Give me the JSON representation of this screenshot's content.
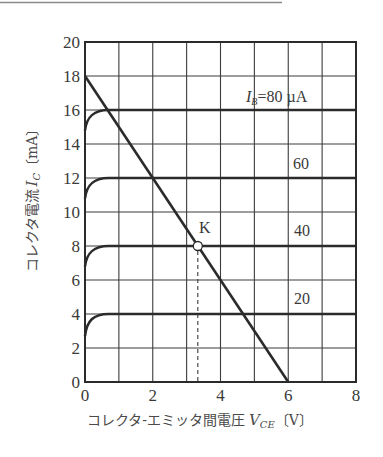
{
  "chart_data": {
    "type": "line",
    "title": "",
    "xlabel": "コレクタ-エミッタ間電圧 V_CE〔V〕",
    "ylabel": "コレクタ電流 I_C〔mA〕",
    "xlim": [
      0,
      8
    ],
    "ylim": [
      0,
      20
    ],
    "grid": true,
    "x_ticks": [
      0,
      2,
      4,
      6,
      8
    ],
    "y_ticks": [
      0,
      2,
      4,
      6,
      8,
      10,
      12,
      14,
      16,
      18,
      20
    ],
    "series": [
      {
        "name": "I_B=20µA",
        "label": "20",
        "saturation_current_mA": 4,
        "points": [
          [
            0,
            2.7
          ],
          [
            0.1,
            3.4
          ],
          [
            0.25,
            3.8
          ],
          [
            0.5,
            3.97
          ],
          [
            0.7,
            4
          ],
          [
            8,
            4
          ]
        ]
      },
      {
        "name": "I_B=40µA",
        "label": "40",
        "saturation_current_mA": 8,
        "points": [
          [
            0,
            6.8
          ],
          [
            0.1,
            7.4
          ],
          [
            0.25,
            7.8
          ],
          [
            0.5,
            7.97
          ],
          [
            0.7,
            8
          ],
          [
            8,
            8
          ]
        ]
      },
      {
        "name": "I_B=60µA",
        "label": "60",
        "saturation_current_mA": 12,
        "points": [
          [
            0,
            10.8
          ],
          [
            0.1,
            11.4
          ],
          [
            0.25,
            11.8
          ],
          [
            0.5,
            11.97
          ],
          [
            0.7,
            12
          ],
          [
            8,
            12
          ]
        ]
      },
      {
        "name": "I_B=80µA",
        "label": "I_B=80 µA",
        "saturation_current_mA": 16,
        "points": [
          [
            0,
            14.8
          ],
          [
            0.1,
            15.4
          ],
          [
            0.25,
            15.8
          ],
          [
            0.5,
            15.97
          ],
          [
            0.7,
            16
          ],
          [
            8,
            16
          ]
        ]
      }
    ],
    "load_line": {
      "name": "load line",
      "points": [
        [
          0,
          18
        ],
        [
          6,
          0
        ]
      ]
    },
    "annotations": [
      {
        "text": "K",
        "type": "operating-point",
        "x": 3.33,
        "y": 8,
        "marker": "open-circle",
        "dashed_drop_to_x_axis": true
      },
      {
        "text": "I_B=80 µA",
        "x": 6.9,
        "y": 17
      },
      {
        "text": "60",
        "x": 6.4,
        "y": 13
      },
      {
        "text": "40",
        "x": 6.4,
        "y": 9
      },
      {
        "text": "20",
        "x": 6.4,
        "y": 5
      }
    ],
    "legend": "none (inline labels)"
  },
  "labels": {
    "ylabel_text": "コレクタ電流",
    "ylabel_var": "I",
    "ylabel_sub": "C",
    "ylabel_unit": "〔mA〕",
    "xlabel_text": "コレクタ-エミッタ間電圧",
    "xlabel_var": "V",
    "xlabel_sub": "CE",
    "xlabel_unit": "〔V〕",
    "ib_prefix": "I",
    "ib_sub": "B",
    "ib_value": "=80",
    "ib_unit": "µA",
    "k_label": "K",
    "curve_60": "60",
    "curve_40": "40",
    "curve_20": "20"
  },
  "colors": {
    "ink": "#2b2b2b",
    "grid": "#3c3c3c",
    "text": "#3a3a3a",
    "top_rule": "#8a8a8a"
  }
}
